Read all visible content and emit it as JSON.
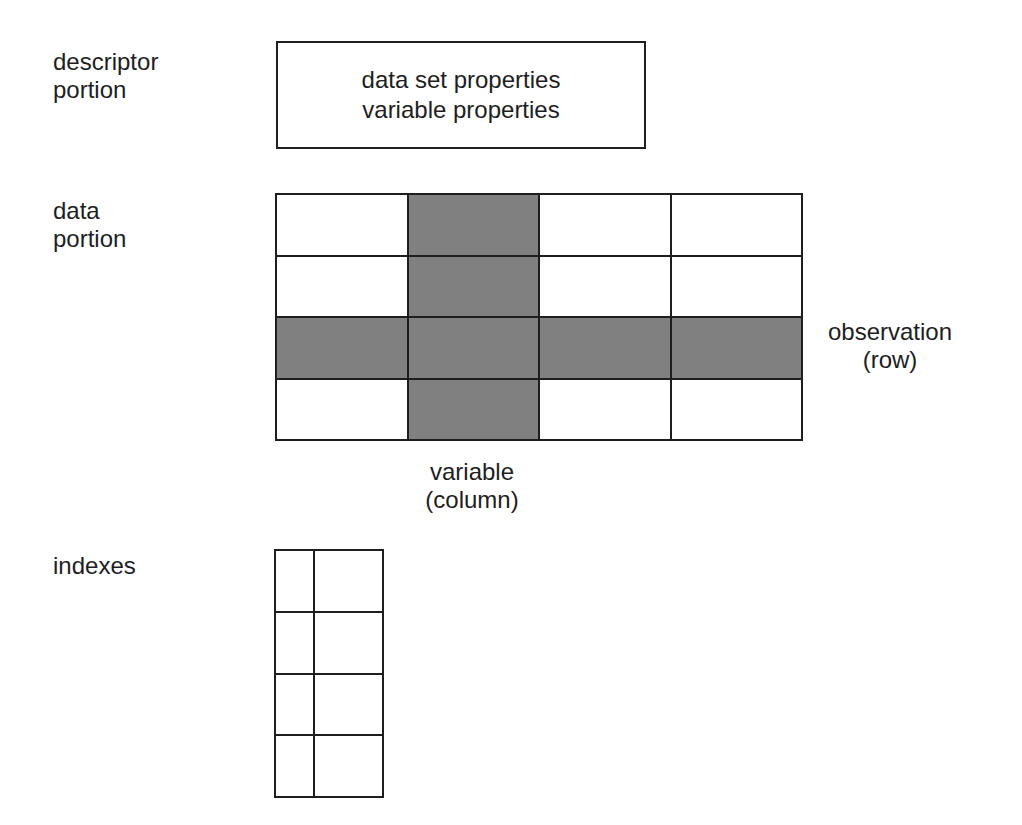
{
  "labels": {
    "descriptor_portion": "descriptor\nportion",
    "data_portion": "data\nportion",
    "indexes": "indexes",
    "observation": "observation\n(row)",
    "variable": "variable\n(column)"
  },
  "descriptor_box": {
    "line1": "data set properties",
    "line2": "variable properties"
  },
  "data_grid": {
    "rows": 4,
    "columns": 4,
    "highlighted_column": 2,
    "highlighted_row": 3,
    "shade_color": "#808080",
    "line_color": "#1e1e1e"
  },
  "index_grid": {
    "rows": 4,
    "columns": 2
  }
}
